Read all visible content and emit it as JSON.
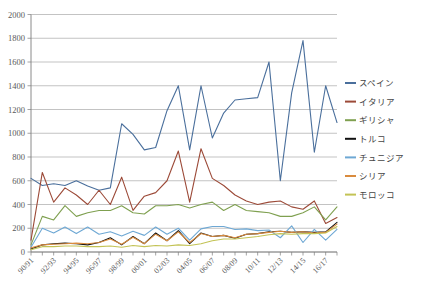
{
  "chart_data": {
    "type": "line",
    "title": "",
    "xlabel": "",
    "ylabel": "",
    "ylim": [
      0,
      2000
    ],
    "ytick_step": 200,
    "ytick_labels": [
      "0",
      "200",
      "400",
      "600",
      "800",
      "1000",
      "1200",
      "1400",
      "1600",
      "1800",
      "2000"
    ],
    "grid": true,
    "legend_position": "right",
    "x": [
      "90/91",
      "91/92",
      "92/93",
      "93/94",
      "94/95",
      "95/96",
      "96/97",
      "97/98",
      "98/99",
      "99/00",
      "00/01",
      "01/02",
      "02/03",
      "03/04",
      "04/05",
      "05/06",
      "06/07",
      "07/08",
      "08/09",
      "09/10",
      "10/11",
      "11/12",
      "12/13",
      "13/14",
      "14/15",
      "15/16",
      "16/17",
      "17/18"
    ],
    "xtick_labels": [
      "90/91",
      "92/93",
      "94/95",
      "96/97",
      "98/99",
      "00/01",
      "02/03",
      "04/05",
      "06/07",
      "08/09",
      "10/11",
      "12/13",
      "14/15",
      "16/17"
    ],
    "xtick_label_every": 2,
    "series": [
      {
        "name": "スペイン",
        "color": "#4a6f9c",
        "values": [
          620,
          560,
          575,
          560,
          600,
          555,
          520,
          540,
          1080,
          990,
          860,
          880,
          1190,
          1400,
          860,
          1400,
          960,
          1170,
          1280,
          1290,
          1300,
          1600,
          600,
          1340,
          1780,
          840,
          1400,
          1090
        ]
      },
      {
        "name": "イタリア",
        "color": "#9c4a38",
        "values": [
          100,
          670,
          420,
          540,
          480,
          400,
          520,
          400,
          630,
          350,
          470,
          500,
          600,
          850,
          420,
          870,
          620,
          560,
          480,
          430,
          400,
          420,
          430,
          380,
          360,
          430,
          240,
          290
        ]
      },
      {
        "name": "ギリシャ",
        "color": "#7fa050",
        "values": [
          60,
          300,
          270,
          390,
          300,
          330,
          350,
          350,
          390,
          330,
          320,
          390,
          390,
          400,
          370,
          400,
          420,
          350,
          400,
          350,
          340,
          330,
          300,
          300,
          330,
          380,
          270,
          380
        ]
      },
      {
        "name": "トルコ",
        "color": "#111111",
        "values": [
          25,
          60,
          70,
          75,
          70,
          60,
          80,
          120,
          60,
          130,
          70,
          160,
          95,
          180,
          70,
          160,
          130,
          140,
          115,
          150,
          155,
          170,
          175,
          165,
          170,
          165,
          170,
          250
        ]
      },
      {
        "name": "チュニジア",
        "color": "#6ea8d4",
        "values": [
          40,
          200,
          160,
          210,
          155,
          210,
          150,
          170,
          135,
          175,
          140,
          210,
          150,
          200,
          100,
          195,
          215,
          215,
          190,
          195,
          180,
          185,
          120,
          220,
          80,
          190,
          100,
          190
        ]
      },
      {
        "name": "シリア",
        "color": "#d98b3e",
        "values": [
          35,
          60,
          65,
          70,
          75,
          70,
          80,
          110,
          65,
          125,
          70,
          150,
          95,
          170,
          80,
          155,
          130,
          140,
          120,
          150,
          155,
          165,
          175,
          165,
          170,
          160,
          165,
          235
        ]
      },
      {
        "name": "モロッコ",
        "color": "#c3c355",
        "values": [
          20,
          45,
          45,
          50,
          50,
          45,
          45,
          50,
          40,
          55,
          45,
          55,
          50,
          60,
          55,
          70,
          95,
          110,
          110,
          120,
          130,
          145,
          155,
          150,
          155,
          155,
          160,
          215
        ]
      }
    ]
  },
  "axes": {
    "y_title": "",
    "x_title": ""
  }
}
